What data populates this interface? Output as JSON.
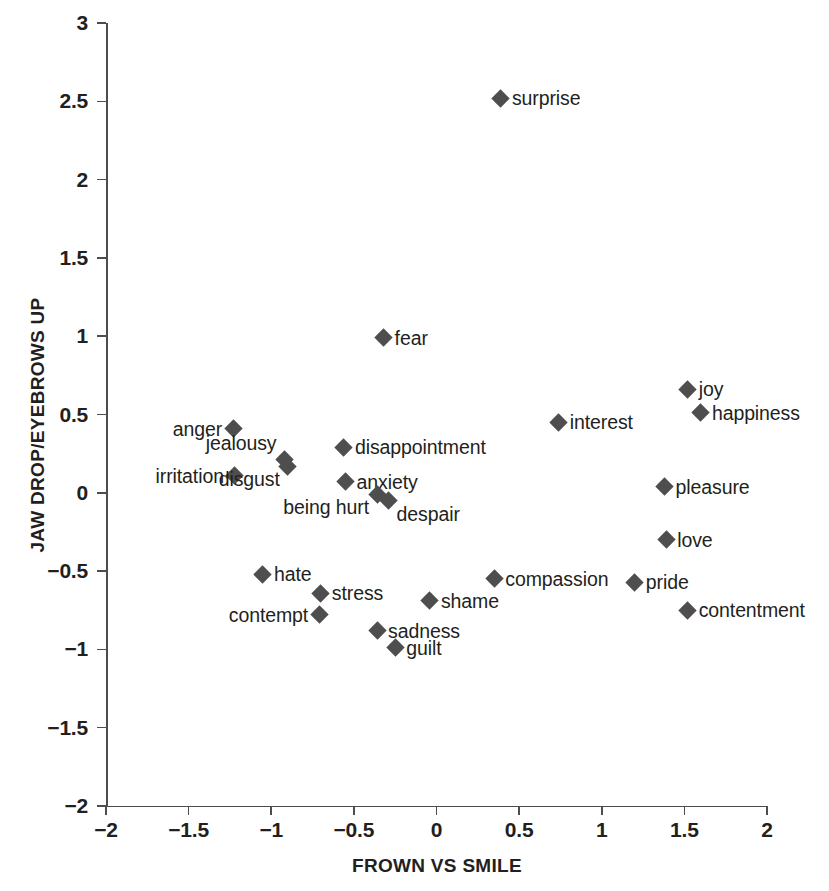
{
  "chart_data": {
    "type": "scatter",
    "title": "",
    "xlabel": "FROWN VS SMILE",
    "ylabel": "JAW DROP/EYEBROWS UP",
    "xlim": [
      -2,
      2
    ],
    "ylim": [
      -2,
      3
    ],
    "xticks": [
      "-2",
      "-1.5",
      "-1",
      "-0.5",
      "0",
      "0.5",
      "1",
      "1.5",
      "2"
    ],
    "xtick_values": [
      -2,
      -1.5,
      -1,
      -0.5,
      0,
      0.5,
      1,
      1.5,
      2
    ],
    "yticks": [
      "3",
      "2.5",
      "2",
      "1.5",
      "1",
      "0.5",
      "0",
      "-0.5",
      "-1",
      "-1.5",
      "-2"
    ],
    "ytick_values": [
      3,
      2.5,
      2,
      1.5,
      1,
      0.5,
      0,
      -0.5,
      -1,
      -1.5,
      -2
    ],
    "grid": false,
    "legend": "none",
    "marker": "diamond",
    "marker_color": "#4e4e4e",
    "points": [
      {
        "label": "surprise",
        "x": 0.39,
        "y": 2.52,
        "label_pos": "right"
      },
      {
        "label": "fear",
        "x": -0.32,
        "y": 0.99,
        "label_pos": "right"
      },
      {
        "label": "joy",
        "x": 1.52,
        "y": 0.66,
        "label_pos": "right"
      },
      {
        "label": "happiness",
        "x": 1.6,
        "y": 0.51,
        "label_pos": "right"
      },
      {
        "label": "interest",
        "x": 0.74,
        "y": 0.45,
        "label_pos": "right"
      },
      {
        "label": "anger",
        "x": -1.23,
        "y": 0.41,
        "label_pos": "left"
      },
      {
        "label": "jealousy",
        "x": -0.92,
        "y": 0.21,
        "label_pos": "above-left"
      },
      {
        "label": "disappointment",
        "x": -0.56,
        "y": 0.29,
        "label_pos": "right"
      },
      {
        "label": "irritation",
        "x": -1.22,
        "y": 0.11,
        "label_pos": "left"
      },
      {
        "label": "disgust",
        "x": -0.9,
        "y": 0.17,
        "label_pos": "below-left"
      },
      {
        "label": "anxiety",
        "x": -0.55,
        "y": 0.07,
        "label_pos": "right"
      },
      {
        "label": "being hurt",
        "x": -0.36,
        "y": -0.01,
        "label_pos": "below-left"
      },
      {
        "label": "despair",
        "x": -0.29,
        "y": -0.05,
        "label_pos": "below"
      },
      {
        "label": "pleasure",
        "x": 1.38,
        "y": 0.04,
        "label_pos": "right"
      },
      {
        "label": "love",
        "x": 1.39,
        "y": -0.3,
        "label_pos": "right"
      },
      {
        "label": "hate",
        "x": -1.05,
        "y": -0.52,
        "label_pos": "right"
      },
      {
        "label": "compassion",
        "x": 0.35,
        "y": -0.55,
        "label_pos": "right"
      },
      {
        "label": "pride",
        "x": 1.2,
        "y": -0.57,
        "label_pos": "right"
      },
      {
        "label": "stress",
        "x": -0.7,
        "y": -0.64,
        "label_pos": "right"
      },
      {
        "label": "shame",
        "x": -0.04,
        "y": -0.69,
        "label_pos": "right"
      },
      {
        "label": "contentment",
        "x": 1.52,
        "y": -0.75,
        "label_pos": "right"
      },
      {
        "label": "contempt",
        "x": -0.71,
        "y": -0.78,
        "label_pos": "left"
      },
      {
        "label": "sadness",
        "x": -0.36,
        "y": -0.88,
        "label_pos": "right"
      },
      {
        "label": "guilt",
        "x": -0.25,
        "y": -0.99,
        "label_pos": "right"
      }
    ]
  }
}
